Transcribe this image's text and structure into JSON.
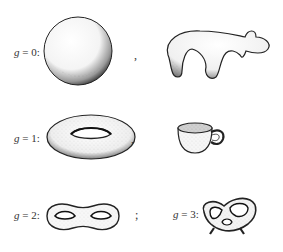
{
  "figure": {
    "rows": [
      {
        "genus_label": "g = 0:",
        "genus_var": "g",
        "genus_value": "= 0:",
        "shapes": [
          "sphere",
          "blob"
        ],
        "separator": ","
      },
      {
        "genus_label": "g = 1:",
        "genus_var": "g",
        "genus_value": "= 1:",
        "shapes": [
          "torus",
          "coffee-cup"
        ],
        "separator": ","
      },
      {
        "genus_label": "g = 2:",
        "genus_var": "g",
        "genus_value": "= 2:",
        "shapes": [
          "double-torus"
        ],
        "separator": ";"
      },
      {
        "genus_label": "g = 3:",
        "genus_var": "g",
        "genus_value": "= 3:",
        "shapes": [
          "pretzel"
        ],
        "separator": ""
      }
    ]
  }
}
